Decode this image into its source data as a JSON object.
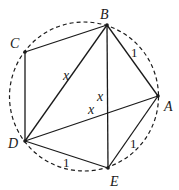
{
  "diagram": {
    "type": "cyclic pentagon inscribed in circle",
    "circle": {
      "cx": 84,
      "cy": 96.5,
      "r": 74.5,
      "style": "dashed"
    },
    "vertices": [
      {
        "name": "A",
        "x": 158,
        "y": 96,
        "label_x": 164,
        "label_y": 111
      },
      {
        "name": "B",
        "x": 107,
        "y": 25,
        "label_x": 100,
        "label_y": 19
      },
      {
        "name": "C",
        "x": 25,
        "y": 52,
        "label_x": 10,
        "label_y": 48
      },
      {
        "name": "D",
        "x": 25,
        "y": 141,
        "label_x": 8,
        "label_y": 148
      },
      {
        "name": "E",
        "x": 108,
        "y": 168,
        "label_x": 110,
        "label_y": 186
      }
    ],
    "edges": [
      {
        "from": "A",
        "to": "B"
      },
      {
        "from": "B",
        "to": "C"
      },
      {
        "from": "C",
        "to": "D"
      },
      {
        "from": "D",
        "to": "E"
      },
      {
        "from": "E",
        "to": "A"
      },
      {
        "from": "B",
        "to": "D"
      },
      {
        "from": "B",
        "to": "E"
      },
      {
        "from": "D",
        "to": "A"
      }
    ],
    "edge_labels": [
      {
        "text": "1",
        "x": 131,
        "y": 57,
        "edge": "AB"
      },
      {
        "text": "1",
        "x": 130,
        "y": 148,
        "edge": "EA"
      },
      {
        "text": "1",
        "x": 63,
        "y": 167,
        "edge": "DE"
      },
      {
        "text": "x",
        "x": 63,
        "y": 80,
        "edge": "BD"
      },
      {
        "text": "x",
        "x": 97,
        "y": 101,
        "edge": "BE"
      },
      {
        "text": "x",
        "x": 88,
        "y": 114,
        "edge": "DA"
      }
    ]
  }
}
